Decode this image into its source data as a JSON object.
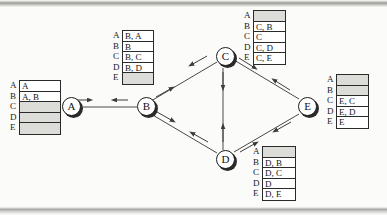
{
  "diagram": {
    "type": "network-graph-with-tables",
    "colors": {
      "node_fill": "#ffffff",
      "node_stroke": "#1c1c1c",
      "node_shadow": "#2b2b2b",
      "edge": "#4a4a4a",
      "table_border": "#2a2a2a",
      "empty_cell": "#dcdcd8",
      "page_background": "#fbfbf9"
    }
  },
  "nodes": [
    {
      "id": "A",
      "label": "A",
      "x": 62,
      "y": 97
    },
    {
      "id": "B",
      "label": "B",
      "x": 137,
      "y": 97
    },
    {
      "id": "C",
      "label": "C",
      "x": 216,
      "y": 47
    },
    {
      "id": "D",
      "label": "D",
      "x": 216,
      "y": 150
    },
    {
      "id": "E",
      "label": "E",
      "x": 298,
      "y": 97
    }
  ],
  "edges": [
    {
      "from": "A",
      "to": "B",
      "bidirectional": true
    },
    {
      "from": "B",
      "to": "C",
      "bidirectional": true
    },
    {
      "from": "B",
      "to": "D",
      "bidirectional": true
    },
    {
      "from": "C",
      "to": "D",
      "bidirectional": true
    },
    {
      "from": "C",
      "to": "E",
      "bidirectional": true
    },
    {
      "from": "D",
      "to": "E",
      "bidirectional": true
    }
  ],
  "tables": [
    {
      "owner": "A",
      "name": "table-a",
      "x": 10,
      "y": 80,
      "row_labels": [
        "A",
        "B",
        "C",
        "D",
        "E"
      ],
      "cells": [
        "A",
        "A, B",
        "",
        "",
        ""
      ]
    },
    {
      "owner": "B",
      "name": "table-b",
      "x": 113,
      "y": 30,
      "row_labels": [
        "A",
        "B",
        "C",
        "D",
        "E"
      ],
      "cells": [
        "B, A",
        "B",
        "B, C",
        "B, D",
        ""
      ]
    },
    {
      "owner": "C",
      "name": "table-c",
      "x": 244,
      "y": 10,
      "row_labels": [
        "A",
        "B",
        "C",
        "D",
        "E"
      ],
      "cells": [
        "",
        "C, B",
        "C",
        "C, D",
        "C, E"
      ]
    },
    {
      "owner": "D",
      "name": "table-d",
      "x": 253,
      "y": 146,
      "row_labels": [
        "A",
        "B",
        "C",
        "D",
        "E"
      ],
      "cells": [
        "",
        "D, B",
        "D, C",
        "D",
        "D, E"
      ]
    },
    {
      "owner": "E",
      "name": "table-e",
      "x": 327,
      "y": 74,
      "row_labels": [
        "A",
        "B",
        "C",
        "D",
        "E"
      ],
      "cells": [
        "",
        "",
        "E, C",
        "E, D",
        "E"
      ]
    }
  ]
}
